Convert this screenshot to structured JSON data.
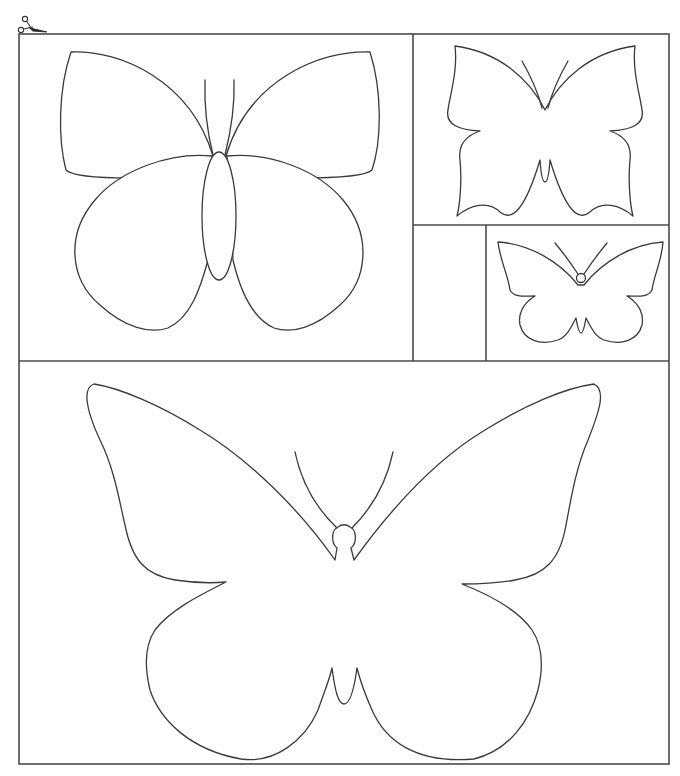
{
  "page": {
    "type": "printable butterfly cut-out template",
    "header_fragment": ""
  },
  "icons": {
    "cut_marker": "scissors-icon"
  },
  "colors": {
    "background": "#ffffff",
    "line": "#3a3a3a",
    "frame": "#4a4a4a"
  },
  "panels": [
    {
      "id": "panel-top-left",
      "content": "butterfly-large-body",
      "label": ""
    },
    {
      "id": "panel-top-right",
      "content": "butterfly-swallowtail",
      "label": ""
    },
    {
      "id": "panel-mid-left-empty",
      "content": "",
      "label": ""
    },
    {
      "id": "panel-mid-right",
      "content": "butterfly-small",
      "label": ""
    },
    {
      "id": "panel-bottom",
      "content": "butterfly-extra-large",
      "label": ""
    }
  ]
}
